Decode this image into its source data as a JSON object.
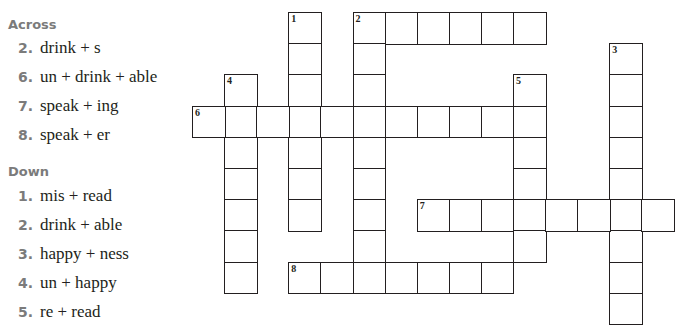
{
  "across": {
    "heading": "Across",
    "clues": [
      {
        "number": "2.",
        "text": "drink + s"
      },
      {
        "number": "6.",
        "text": "un + drink + able"
      },
      {
        "number": "7.",
        "text": "speak + ing"
      },
      {
        "number": "8.",
        "text": "speak + er"
      }
    ]
  },
  "down": {
    "heading": "Down",
    "clues": [
      {
        "number": "1.",
        "text": "mis + read"
      },
      {
        "number": "2.",
        "text": "drink + able"
      },
      {
        "number": "3.",
        "text": "happy + ness"
      },
      {
        "number": "4.",
        "text": "un + happy"
      },
      {
        "number": "5.",
        "text": "re + read"
      }
    ]
  },
  "grid": {
    "origin_x": 192,
    "origin_y": 12,
    "col_step": 32.1,
    "row_step": 31.2,
    "entries": [
      {
        "number": "1",
        "direction": "down",
        "col": 3,
        "row": 0,
        "length": 7
      },
      {
        "number": "2",
        "direction": "across",
        "col": 5,
        "row": 0,
        "length": 6
      },
      {
        "number": "2",
        "direction": "down",
        "col": 5,
        "row": 0,
        "length": 9
      },
      {
        "number": "3",
        "direction": "down",
        "col": 13,
        "row": 1,
        "length": 9
      },
      {
        "number": "4",
        "direction": "down",
        "col": 1,
        "row": 2,
        "length": 7
      },
      {
        "number": "5",
        "direction": "down",
        "col": 10,
        "row": 2,
        "length": 6
      },
      {
        "number": "6",
        "direction": "across",
        "col": 0,
        "row": 3,
        "length": 11
      },
      {
        "number": "7",
        "direction": "across",
        "col": 7,
        "row": 6,
        "length": 8
      },
      {
        "number": "8",
        "direction": "across",
        "col": 3,
        "row": 8,
        "length": 7
      }
    ]
  }
}
